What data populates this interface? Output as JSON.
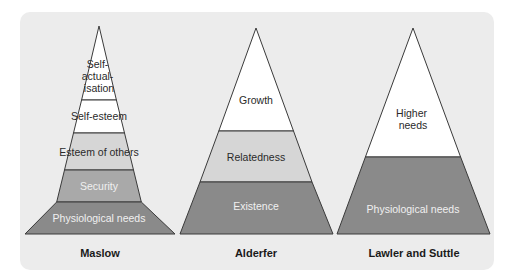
{
  "colors": {
    "panel_bg": "#ececec",
    "white_band": "#ffffff",
    "light_band": "#d6d6d6",
    "mid_band": "#a9a9a9",
    "dark_band": "#8a8a8a",
    "outline": "#3a3a3a",
    "dark_text": "#2a2a2a",
    "light_text": "#f0f0f0"
  },
  "pyramids": [
    {
      "caption": "Maslow",
      "levels": [
        {
          "label_lines": [
            "Self-",
            "actual-",
            "isation"
          ],
          "shade": "white"
        },
        {
          "label_lines": [
            "Self-esteem"
          ],
          "shade": "white"
        },
        {
          "label_lines": [
            "Esteem of others"
          ],
          "shade": "light"
        },
        {
          "label_lines": [
            "Security"
          ],
          "shade": "mid"
        },
        {
          "label_lines": [
            "Physiological needs"
          ],
          "shade": "dark"
        }
      ]
    },
    {
      "caption": "Alderfer",
      "levels": [
        {
          "label_lines": [
            "Growth"
          ],
          "shade": "white"
        },
        {
          "label_lines": [
            "Relatedness"
          ],
          "shade": "light"
        },
        {
          "label_lines": [
            "Existence"
          ],
          "shade": "dark"
        }
      ]
    },
    {
      "caption": "Lawler and Suttle",
      "levels": [
        {
          "label_lines": [
            "Higher",
            "needs"
          ],
          "shade": "white"
        },
        {
          "label_lines": [
            "Physiological needs"
          ],
          "shade": "dark"
        }
      ]
    }
  ]
}
